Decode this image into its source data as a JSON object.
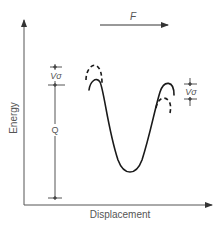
{
  "diagram": {
    "force_label": "F",
    "y_axis_label": "Energy",
    "x_axis_label": "Displacement",
    "left_bracket": {
      "upper_label": "Vσ",
      "lower_label": "Q"
    },
    "right_bracket": {
      "label": "Vσ"
    },
    "colors": {
      "ink": "#1a1a1a",
      "axis": "#555555",
      "text": "#555555"
    }
  }
}
